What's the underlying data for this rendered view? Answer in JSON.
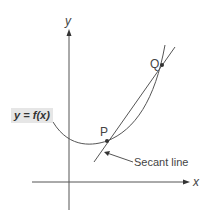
{
  "diagram": {
    "axes": {
      "x_label": "x",
      "y_label": "y"
    },
    "function_label": "y = f(x)",
    "points": [
      {
        "name": "P",
        "label": "P"
      },
      {
        "name": "Q",
        "label": "Q"
      }
    ],
    "secant_label": "Secant line",
    "colors": {
      "curve": "#555555",
      "axes": "#555555",
      "label_bg": "#e6e6e6"
    }
  }
}
